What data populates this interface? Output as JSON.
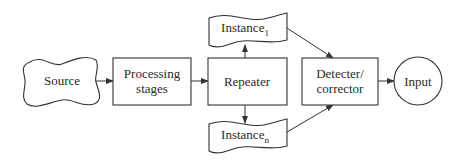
{
  "diagram": {
    "nodes": {
      "source": {
        "label": "Source",
        "shape": "cloud"
      },
      "processing": {
        "label_line1": "Processing",
        "label_line2": "stages",
        "shape": "rectangle"
      },
      "repeater": {
        "label": "Repeater",
        "shape": "rectangle"
      },
      "instance1": {
        "label": "Instance",
        "subscript": "1",
        "shape": "document-wave"
      },
      "instancen": {
        "label": "Instance",
        "subscript": "n",
        "shape": "document-wave"
      },
      "detector": {
        "label_line1": "Detecter/",
        "label_line2": "corrector",
        "shape": "rectangle"
      },
      "input": {
        "label": "Input",
        "shape": "circle"
      }
    },
    "edges": [
      {
        "from": "Source",
        "to": "Processing stages"
      },
      {
        "from": "Processing stages",
        "to": "Repeater"
      },
      {
        "from": "Repeater",
        "to": "Instance1"
      },
      {
        "from": "Repeater",
        "to": "Instancen"
      },
      {
        "from": "Instance1",
        "to": "Detecter/corrector"
      },
      {
        "from": "Instancen",
        "to": "Detecter/corrector"
      },
      {
        "from": "Detecter/corrector",
        "to": "Input"
      }
    ],
    "colors": {
      "stroke": "#333333",
      "text": "#2a2a2a",
      "background": "#ffffff"
    }
  }
}
